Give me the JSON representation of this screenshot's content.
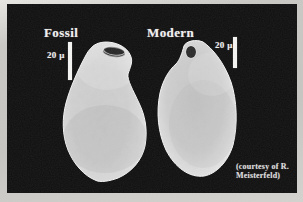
{
  "figure": {
    "type": "sem-micrograph-comparison",
    "panels": [
      {
        "id": "fossil",
        "label": "Fossil",
        "scale_bar": {
          "label": "20 μ"
        }
      },
      {
        "id": "modern",
        "label": "Modern",
        "scale_bar": {
          "label": "20 μ"
        }
      }
    ],
    "credit": {
      "line1": "(courtesy of R.",
      "line2": "Meisterfeld)"
    },
    "colors": {
      "frame": "#c9c8c4",
      "photo_background": "#0f0f0f",
      "label_text": "#efefef",
      "scale_bar": "#f2f2f0",
      "specimen_base": "#cfcfcf",
      "aperture": "#262626"
    }
  }
}
